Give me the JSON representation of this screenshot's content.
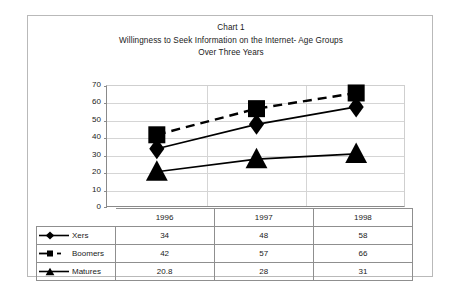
{
  "chart_data": {
    "type": "line",
    "title": "Chart 1",
    "subtitle": "Willingness to Seek Information on the Internet- Age Groups",
    "subtitle2": "Over Three Years",
    "title_lines": [
      "Chart 1",
      "Willingness to Seek Information on the Internet- Age Groups",
      "Over Three Years"
    ],
    "categories": [
      "1996",
      "1997",
      "1998"
    ],
    "series": [
      {
        "name": "Xers",
        "values": [
          34,
          48,
          58
        ],
        "marker": "diamond",
        "line_style": "solid",
        "color": "#000000"
      },
      {
        "name": "Boomers",
        "values": [
          42,
          57,
          66
        ],
        "marker": "square",
        "line_style": "dashed",
        "color": "#000000"
      },
      {
        "name": "Matures",
        "values": [
          20.8,
          28,
          31
        ],
        "marker": "triangle",
        "line_style": "solid",
        "color": "#000000"
      }
    ],
    "xlabel": "",
    "ylabel": "",
    "ylim": [
      0,
      70
    ],
    "yticks": [
      "70",
      "60",
      "50",
      "40",
      "30",
      "20",
      "10",
      "0"
    ],
    "ytick_values": [
      70,
      60,
      50,
      40,
      30,
      20,
      10,
      0
    ],
    "grid": true,
    "legend_position": "data-table-left",
    "has_data_table": true
  },
  "data_table": {
    "header_row": [
      "",
      "1996",
      "1997",
      "1998"
    ],
    "rows": [
      {
        "label": "Xers",
        "values": [
          "34",
          "48",
          "58"
        ]
      },
      {
        "label": "Boomers",
        "values": [
          "42",
          "57",
          "66"
        ]
      },
      {
        "label": "Matures",
        "values": [
          "20.8",
          "28",
          "31"
        ]
      }
    ]
  },
  "colors": {
    "series": "#000000",
    "gridline": "#d5d5d5",
    "axis": "#8a8a8a",
    "table_border": "#8f8f8f",
    "frame": "#b9b9b9",
    "background": "#ffffff"
  }
}
